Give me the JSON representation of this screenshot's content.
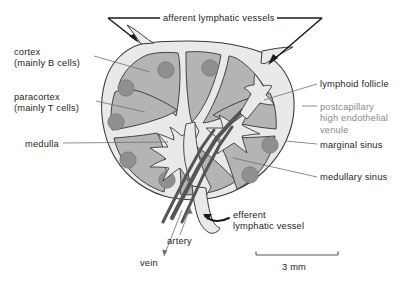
{
  "figure": {
    "background_color": "#ffffff",
    "text_color": "#231f20",
    "muted_text_color": "#8a8a8a"
  },
  "labels": {
    "cortex": "cortex\n(mainly B cells)",
    "paracortex": "paracortex\n(mainly T cells)",
    "medulla": "medulla",
    "afferent_lymphatic_vessels": "afferent lymphatic vessels",
    "lymphoid_follicle": "lymphoid follicle",
    "postcapillary_hev": "postcapillary\nhigh endothelial\nvenule",
    "marginal_sinus": "marginal sinus",
    "medullary_sinus": "medullary sinus",
    "efferent_lymphatic_vessel": "efferent\nlymphatic vessel",
    "artery": "artery",
    "vein": "vein"
  },
  "scale_bar": {
    "caption": "3 mm",
    "length_mm": 3
  },
  "colors": {
    "capsule_fill": "#e9e9e9",
    "lobule_fill": "#b4b4b4",
    "follicle_fill": "#8f8f8f",
    "vessel_dark": "#555555",
    "outline": "#3a3a3a",
    "leader_line": "#6f6f6f"
  }
}
